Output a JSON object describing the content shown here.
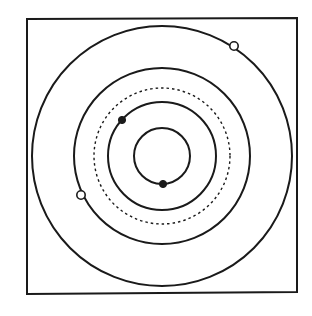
{
  "diagram": {
    "type": "concentric-orbits",
    "colors": {
      "background": "#ffffff",
      "stroke": "#1a1a1a"
    },
    "frame": {
      "x": 27,
      "y": 18,
      "width": 270,
      "height": 275
    },
    "center": {
      "x": 162,
      "y": 156
    },
    "rings": [
      {
        "id": "inner",
        "radius": 28,
        "style": "solid"
      },
      {
        "id": "third",
        "radius": 54,
        "style": "solid"
      },
      {
        "id": "dashed",
        "radius": 68,
        "style": "dashed"
      },
      {
        "id": "second",
        "radius": 88,
        "style": "solid"
      },
      {
        "id": "outer",
        "radius": 130,
        "style": "solid"
      }
    ],
    "markers": [
      {
        "ring": "inner",
        "x": 163,
        "y": 184,
        "kind": "filled"
      },
      {
        "ring": "third",
        "x": 122,
        "y": 120,
        "kind": "filled"
      },
      {
        "ring": "second",
        "x": 81,
        "y": 195,
        "kind": "open"
      },
      {
        "ring": "outer",
        "x": 234,
        "y": 46,
        "kind": "open"
      }
    ]
  }
}
